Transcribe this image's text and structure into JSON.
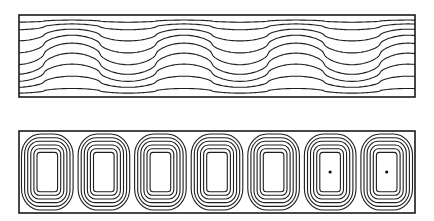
{
  "figure": {
    "panels": [
      {
        "id": "temperature-field",
        "kind": "wavy-isotherms",
        "box": {
          "x": 19,
          "y": 15,
          "w": 396,
          "h": 82
        },
        "wavelength_px": 112,
        "crests_x": [
          72,
          184,
          296,
          408
        ],
        "troughs_x": [
          128,
          240,
          352
        ],
        "line_count": 9,
        "levels": [
          0.05,
          0.12,
          0.22,
          0.33,
          0.45,
          0.57,
          0.68,
          0.79,
          0.9
        ]
      },
      {
        "id": "stream-function",
        "kind": "convection-cells",
        "box": {
          "x": 19,
          "y": 131,
          "w": 396,
          "h": 82
        },
        "cell_count": 7,
        "contours_per_cell": 6,
        "cells_with_center_dot": [
          6,
          7
        ]
      }
    ],
    "colors": {
      "line": "#1e1e1e",
      "background": "#ffffff"
    }
  }
}
